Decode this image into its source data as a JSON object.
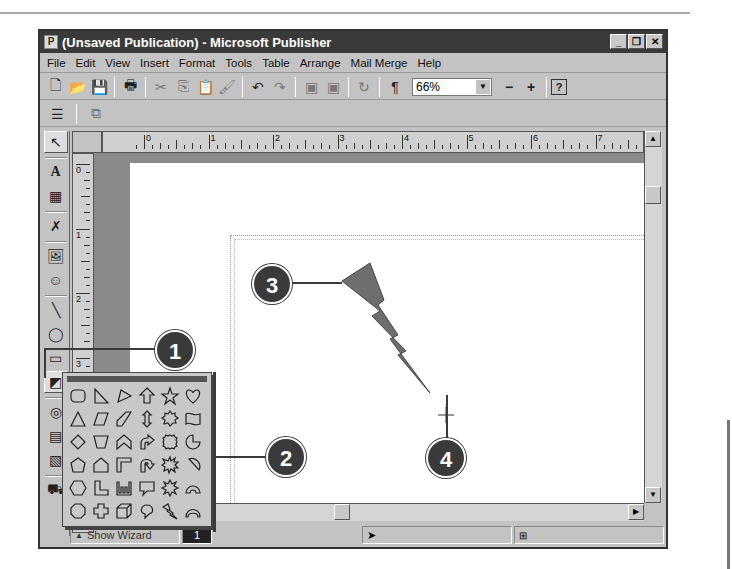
{
  "window": {
    "title": "(Unsaved Publication) - Microsoft Publisher",
    "controls": {
      "minimize": "_",
      "restore": "❐",
      "close": "✕"
    }
  },
  "menu": [
    "File",
    "Edit",
    "View",
    "Insert",
    "Format",
    "Tools",
    "Table",
    "Arrange",
    "Mail Merge",
    "Help"
  ],
  "toolbar": {
    "buttons": [
      "new",
      "open",
      "save",
      "print",
      "cut",
      "copy",
      "paste",
      "format-painter",
      "undo",
      "redo",
      "bring-to-front",
      "send-to-back",
      "rotate",
      "show-special-characters"
    ],
    "zoom_value": "66%",
    "zoom_out": "−",
    "zoom_in": "+",
    "help": "?"
  },
  "toolbar2": {
    "buttons": [
      "align",
      "group"
    ]
  },
  "objects_toolbar": [
    "pointer",
    "text-frame",
    "table-frame",
    "wordart-frame",
    "picture-frame",
    "clip-gallery",
    "line",
    "oval",
    "rectangle",
    "custom-shapes",
    "design-gallery",
    "hot-spot",
    "form-control",
    "design-checker"
  ],
  "ruler": {
    "h_labels": [
      "0",
      "1",
      "2",
      "3",
      "4",
      "5",
      "6",
      "7",
      "8"
    ],
    "v_labels": [
      "0",
      "1",
      "2",
      "3"
    ]
  },
  "shapes_palette": {
    "shapes": [
      "rounded-rectangle",
      "right-triangle",
      "pennant",
      "up-arrow",
      "star",
      "heart",
      "triangle",
      "parallelogram",
      "diagonal-band",
      "up-down-arrow",
      "seal",
      "wave",
      "diamond",
      "trapezoid",
      "chevron",
      "bent-arrow",
      "circle-seal",
      "pie",
      "pentagon",
      "house",
      "corner",
      "u-turn-arrow",
      "explosion",
      "chord",
      "hexagon",
      "l-shape",
      "comb",
      "speech-bubble",
      "starburst",
      "arch",
      "octagon",
      "cross",
      "cube",
      "thought-bubble",
      "lightning-bolt",
      "moon-arch"
    ]
  },
  "status": {
    "show_wizard": "Show Wizard",
    "page_num": "1"
  },
  "callouts": [
    "1",
    "2",
    "3",
    "4"
  ],
  "colors": {
    "callout": "#3a3a3a",
    "lightning": "#6e6e6e",
    "workspace": "#8a8a8a"
  }
}
